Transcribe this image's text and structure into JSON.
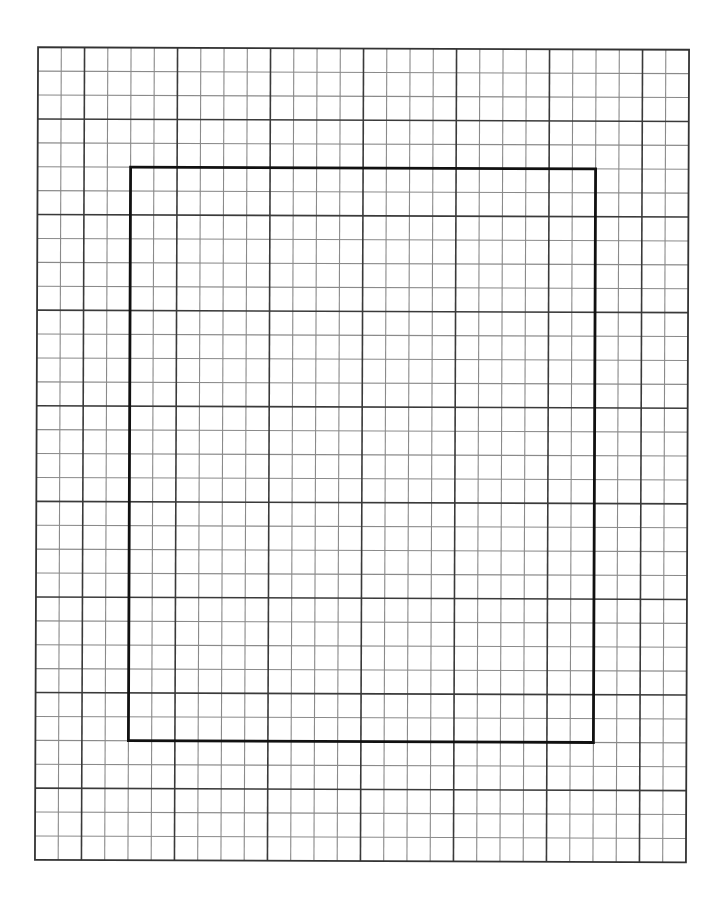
{
  "page": {
    "type": "graph-paper",
    "background": "#ffffff"
  },
  "grid": {
    "origin_x": 36.5,
    "origin_y": 48.5,
    "columns": 28,
    "rows": 34,
    "cell_width": 23.25,
    "cell_height": 23.9,
    "major_every": 4,
    "major_col_offset": 2,
    "major_row_offset": 3,
    "rotation_deg": 0.22,
    "minor_color": "#8a8a8a",
    "major_color": "#3a3a3a",
    "border_color": "#333333",
    "minor_width": 1.1,
    "major_width": 1.6
  },
  "highlight_rect": {
    "col_start": 4,
    "col_end": 24,
    "row_start": 5,
    "row_end": 29,
    "color": "#111111",
    "width": 2.8
  }
}
